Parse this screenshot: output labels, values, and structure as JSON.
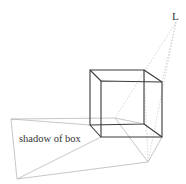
{
  "diagram": {
    "labels": {
      "light": "L",
      "shadow": "shadow of box"
    },
    "colors": {
      "cube_edge": "#3a3a3a",
      "shadow_edge": "#b8b8b8",
      "ray": "#c4c4c4",
      "text": "#333333",
      "background": "#ffffff"
    },
    "points": {
      "light": [
        176,
        22
      ],
      "cube": {
        "back_top_left": [
          90,
          70
        ],
        "back_top_right": [
          144,
          70
        ],
        "front_top_left": [
          101,
          81
        ],
        "front_top_right": [
          162,
          82
        ],
        "back_bottom_left": [
          90,
          125
        ],
        "back_bottom_right": [
          144,
          124
        ],
        "front_bottom_left": [
          101,
          137
        ],
        "front_bottom_right": [
          162,
          137
        ]
      },
      "shadow": {
        "far_left": [
          11,
          119
        ],
        "bottom_left": [
          17,
          179
        ],
        "bottom_right": [
          148,
          162
        ],
        "inner": [
          115,
          118
        ]
      }
    }
  }
}
